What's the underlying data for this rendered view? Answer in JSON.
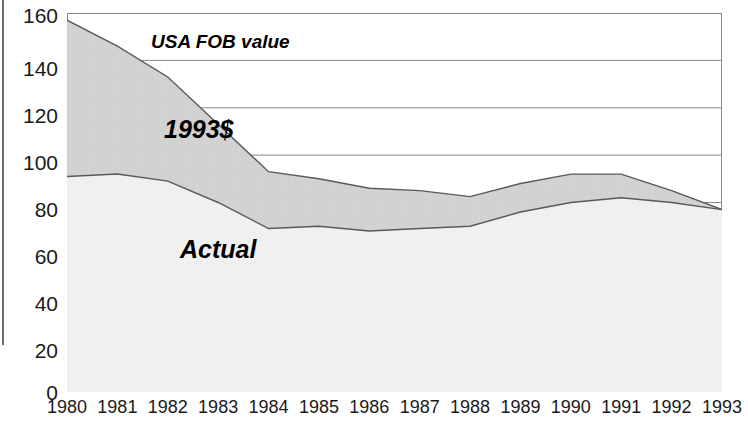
{
  "chart_data": {
    "type": "area",
    "title": "",
    "subtitle": "",
    "xlabel": "",
    "ylabel": "",
    "xlim": [
      1980,
      1993
    ],
    "ylim": [
      0,
      160
    ],
    "ytick_step": 20,
    "grid": true,
    "grid_orientation": "horizontal",
    "legend_position": "inline-annotations",
    "categories": [
      1980,
      1981,
      1982,
      1983,
      1984,
      1985,
      1986,
      1987,
      1988,
      1989,
      1990,
      1991,
      1992,
      1993
    ],
    "series": [
      {
        "name": "1993$",
        "annotation": "1993$",
        "fill": "#d2d2d2",
        "values": [
          157,
          146,
          133,
          113,
          93,
          90,
          86,
          85,
          82.5,
          88,
          92,
          92,
          85,
          77
        ]
      },
      {
        "name": "Actual",
        "annotation": "Actual",
        "fill": "#f0f0f0",
        "values": [
          91,
          92,
          89,
          80,
          69,
          70,
          68,
          69,
          70,
          76,
          80,
          82,
          80,
          77
        ]
      }
    ],
    "annotations": [
      {
        "id": "usa-fob-value",
        "text": "USA FOB value"
      },
      {
        "id": "series-1993",
        "text": "1993$"
      },
      {
        "id": "series-actual",
        "text": "Actual"
      }
    ],
    "ticks": {
      "y": [
        "160",
        "140",
        "120",
        "100",
        "80",
        "60",
        "40",
        "20",
        "0"
      ],
      "x": [
        "1980",
        "1981",
        "1982",
        "1983",
        "1984",
        "1985",
        "1986",
        "1987",
        "1988",
        "1989",
        "1990",
        "1991",
        "1992",
        "1993"
      ]
    },
    "colors": {
      "band_1993_fill": "#d2d2d2",
      "band_actual_fill": "#f0f0f0",
      "line": "#595959",
      "grid": "#8a8a8a",
      "frame": "#8a8a8a",
      "text": "#1a1a1a"
    }
  }
}
